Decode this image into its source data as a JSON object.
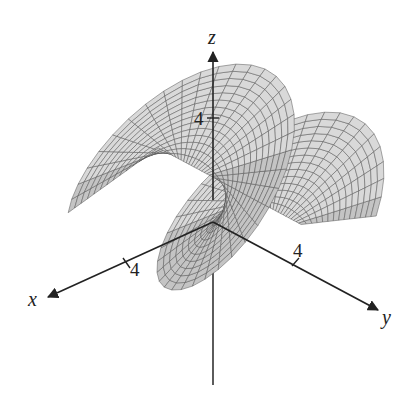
{
  "figure": {
    "type": "3d-parametric-surface",
    "colors": {
      "background": "#ffffff",
      "surface_fill": "#d9d9d9",
      "surface_fill_dark": "#c4c4c4",
      "mesh_line": "#555555",
      "axis": "#222222"
    },
    "axes": {
      "x": {
        "label": "x",
        "tick": "4"
      },
      "y": {
        "label": "y",
        "tick": "4"
      },
      "z": {
        "label": "z",
        "tick": "4"
      }
    }
  }
}
